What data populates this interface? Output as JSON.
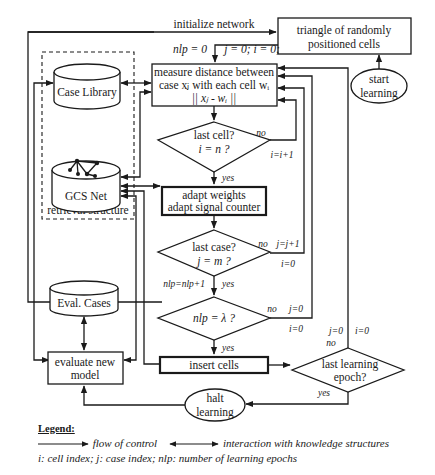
{
  "diagram": {
    "labels": {
      "initialize_network": "initialize network",
      "nlp_init": "nlp = 0",
      "ji_init": "j = 0; i = 0;",
      "start_learning": [
        "start",
        "learning"
      ],
      "triangle_cells": [
        "triangle of randomly",
        "positioned cells"
      ],
      "measure_distance": [
        "measure distance between",
        "case xⱼ with each cell  wᵢ",
        "|| xⱼ - wᵢ ||"
      ],
      "case_library": "Case Library",
      "gcs_net": "GCS Net",
      "retrieval_structure": "retrieval structure",
      "last_cell": [
        "last cell?",
        "i = n ?"
      ],
      "last_cell_no": "no",
      "last_cell_incr": "i=i+1",
      "last_cell_yes": "yes",
      "adapt": [
        "adapt weights",
        "adapt signal counter"
      ],
      "last_case": [
        "last case?",
        "j = m ?"
      ],
      "last_case_no": "no",
      "last_case_incr_j": "j=j+1",
      "last_case_reset_i": "i=0",
      "nlp_incr": "nlp=nlp+1",
      "last_case_yes": "yes",
      "nlp_lambda": "nlp = λ ?",
      "nlp_lambda_no": "no",
      "nlp_lambda_reset_j": "j=0",
      "nlp_lambda_reset_i": "i=0",
      "nlp_lambda_yes": "yes",
      "eval_cases": "Eval. Cases",
      "evaluate_model": [
        "evaluate new",
        "model"
      ],
      "insert_cells": "insert cells",
      "last_epoch": [
        "last learning",
        "epoch?"
      ],
      "last_epoch_no": "no",
      "last_epoch_reset_j": "j=0",
      "last_epoch_reset_i": "i=0",
      "last_epoch_yes": "yes",
      "halt_learning": [
        "halt",
        "learning"
      ]
    }
  },
  "legend": {
    "title": "Legend:",
    "flow_of_control": "flow of control",
    "interaction": "interaction with knowledge structures",
    "indices": "i: cell index; j: case index; nlp: number of learning epochs"
  },
  "colors": {
    "ink": "#1a1a1a",
    "background": "#ffffff"
  }
}
